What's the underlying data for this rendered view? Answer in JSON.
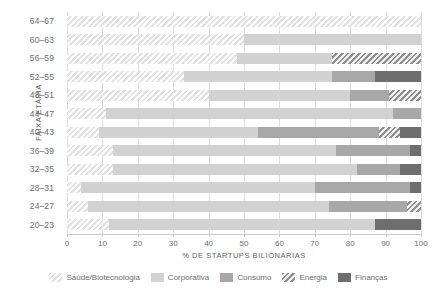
{
  "chart_data": {
    "type": "bar",
    "orientation": "horizontal",
    "stacked": true,
    "stack_total": 100,
    "title": "",
    "xlabel": "% DE STARTUPS BILIONÁRIAS",
    "ylabel": "FAIXA ETÁRIA",
    "xlim": [
      0,
      100
    ],
    "xticks": [
      0,
      10,
      20,
      30,
      40,
      50,
      60,
      70,
      80,
      90,
      100
    ],
    "xtick_labels": [
      "0",
      "10",
      "20",
      "30",
      "40",
      "50",
      "60",
      "70",
      "80",
      "90",
      "100"
    ],
    "grid": true,
    "grid_axis": "x",
    "legend_position": "bottom",
    "categories": [
      "64–67",
      "60–63",
      "56–59",
      "52–55",
      "48–51",
      "44–47",
      "40–43",
      "36–39",
      "32–35",
      "28–31",
      "24–27",
      "20–23"
    ],
    "series": [
      {
        "name": "Saúde/Biotecnologia",
        "color": "#e6e6e6",
        "pattern": "diagonal-hatch-light",
        "values": [
          100,
          50,
          48,
          33,
          40,
          11,
          9,
          13,
          13,
          4,
          6,
          12
        ]
      },
      {
        "name": "Corporativa",
        "color": "#d2d2d2",
        "pattern": "solid",
        "values": [
          0,
          50,
          27,
          42,
          40,
          81,
          45,
          63,
          69,
          66,
          68,
          75
        ]
      },
      {
        "name": "Consumo",
        "color": "#a8a8a8",
        "pattern": "solid",
        "values": [
          0,
          0,
          0,
          12,
          11,
          8,
          34,
          21,
          12,
          27,
          22,
          0
        ]
      },
      {
        "name": "Energia",
        "color": "#b9b9b9",
        "pattern": "diagonal-hatch-dark",
        "values": [
          0,
          0,
          25,
          0,
          9,
          0,
          6,
          0,
          0,
          0,
          4,
          0
        ]
      },
      {
        "name": "Finanças",
        "color": "#6e6e6e",
        "pattern": "solid",
        "values": [
          0,
          0,
          0,
          13,
          0,
          0,
          6,
          3,
          6,
          3,
          0,
          13
        ]
      }
    ]
  },
  "legend": {
    "items": [
      {
        "label": "Saúde/Biotecnologia",
        "swatch": "cat-saude"
      },
      {
        "label": "Corporativa",
        "swatch": "cat-corporativa"
      },
      {
        "label": "Consumo",
        "swatch": "cat-consumo"
      },
      {
        "label": "Energia",
        "swatch": "cat-energia"
      },
      {
        "label": "Finanças",
        "swatch": "cat-financas"
      }
    ]
  }
}
